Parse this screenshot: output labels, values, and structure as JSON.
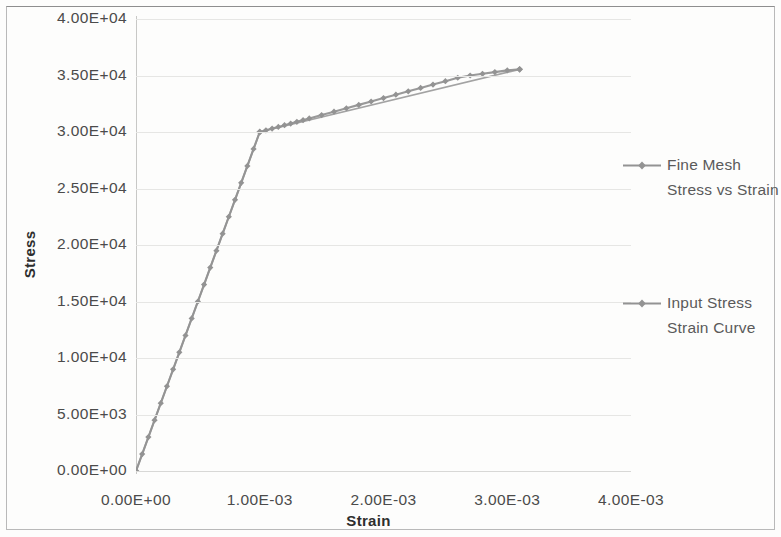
{
  "chart_data": {
    "type": "line",
    "title": "",
    "xlabel": "Strain",
    "ylabel": "Stress",
    "xlim": [
      0,
      0.004
    ],
    "ylim": [
      0,
      40000
    ],
    "grid": true,
    "legend_position": "right",
    "xticks": [
      "0.00E+00",
      "1.00E-03",
      "2.00E-03",
      "3.00E-03",
      "4.00E-03"
    ],
    "xtick_values": [
      0,
      0.001,
      0.002,
      0.003,
      0.004
    ],
    "yticks": [
      "0.00E+00",
      "5.00E+03",
      "1.00E+04",
      "1.50E+04",
      "2.00E+04",
      "2.50E+04",
      "3.00E+04",
      "3.50E+04",
      "4.00E+04"
    ],
    "ytick_values": [
      0,
      5000,
      10000,
      15000,
      20000,
      25000,
      30000,
      35000,
      40000
    ],
    "series": [
      {
        "name": "Fine Mesh Stress vs Strain",
        "color": "#939393",
        "marker": "diamond",
        "x": [
          0,
          5e-05,
          0.0001,
          0.00015,
          0.0002,
          0.00025,
          0.0003,
          0.00035,
          0.0004,
          0.00045,
          0.0005,
          0.00055,
          0.0006,
          0.00065,
          0.0007,
          0.00075,
          0.0008,
          0.00085,
          0.0009,
          0.00095,
          0.001,
          0.00105,
          0.0011,
          0.00115,
          0.0012,
          0.00125,
          0.0013,
          0.00135,
          0.0014,
          0.0015,
          0.0016,
          0.0017,
          0.0018,
          0.0019,
          0.002,
          0.0021,
          0.0022,
          0.0023,
          0.0024,
          0.0025,
          0.0026,
          0.0027,
          0.0028,
          0.0029,
          0.003,
          0.0031
        ],
        "y": [
          0,
          1500,
          3000,
          4500,
          6000,
          7500,
          9000,
          10500,
          12000,
          13500,
          15000,
          16500,
          18000,
          19500,
          21000,
          22500,
          24000,
          25500,
          27000,
          28500,
          30000,
          30150,
          30300,
          30450,
          30600,
          30750,
          30900,
          31050,
          31200,
          31500,
          31800,
          32100,
          32400,
          32700,
          33000,
          33300,
          33600,
          33900,
          34200,
          34500,
          34800,
          35000,
          35150,
          35300,
          35450,
          35550
        ]
      },
      {
        "name": "Input Stress Strain Curve",
        "color": "#939393",
        "marker": "diamond",
        "x": [
          0,
          0.001,
          0.0031
        ],
        "y": [
          0,
          30000,
          35550
        ]
      }
    ],
    "annotations": [
      {
        "label": "yield point",
        "x": 0.001,
        "y": 30000
      }
    ]
  },
  "legend": {
    "entries": [
      {
        "label": "Fine Mesh Stress vs Strain",
        "lines": [
          "Fine Mesh",
          "Stress vs",
          "Strain"
        ]
      },
      {
        "label": "Input Stress Strain Curve",
        "lines": [
          "Input Stress",
          "Strain Curve"
        ]
      }
    ]
  },
  "colors": {
    "series_line": "#939393",
    "gridline": "#e6e6e4",
    "axis": "#c8c8c6",
    "tick_text": "#4b4b4b",
    "title_text": "#2e2e2e",
    "legend_text": "#5a5a5a",
    "frame": "#b9b9b9",
    "background": "#fdfdfc"
  }
}
